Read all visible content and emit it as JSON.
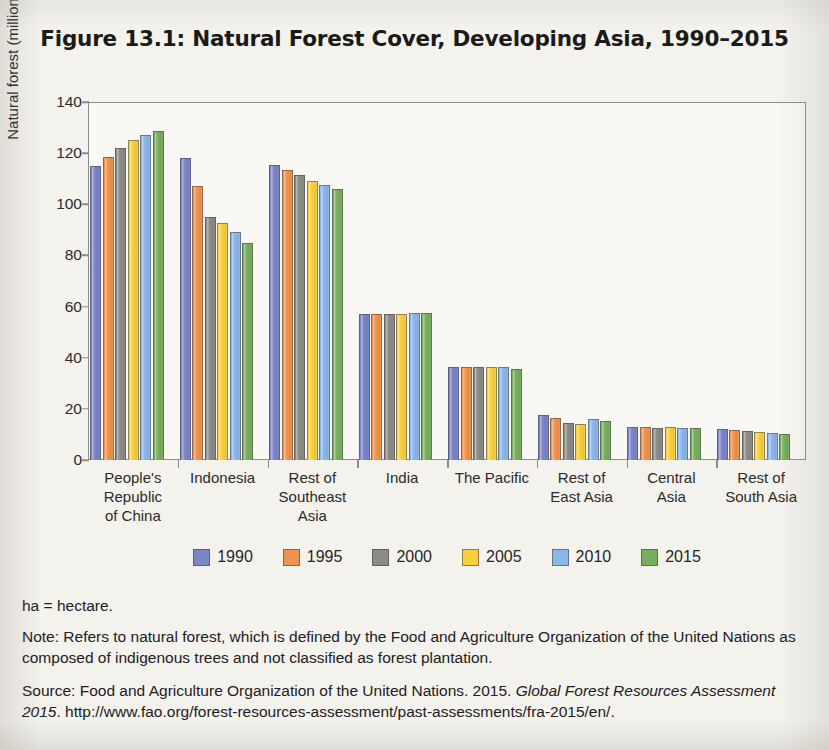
{
  "title": "Figure 13.1: Natural Forest Cover, Developing Asia, 1990–2015",
  "axes": {
    "ylabel": "Natural forest (million ha)",
    "yticks": [
      "140",
      "120",
      "100",
      "80",
      "60",
      "40",
      "20",
      "0"
    ]
  },
  "legend": [
    {
      "label": "1990",
      "color": "#7b85c8"
    },
    {
      "label": "1995",
      "color": "#f0934e"
    },
    {
      "label": "2000",
      "color": "#8d8b86"
    },
    {
      "label": "2005",
      "color": "#f7cf3f"
    },
    {
      "label": "2010",
      "color": "#8cb6e8"
    },
    {
      "label": "2015",
      "color": "#79ae5f"
    }
  ],
  "notes": {
    "abbrev": "ha = hectare.",
    "note": "Note: Refers to natural forest, which is defined by the Food and Agriculture Organization of the United Nations as composed of indigenous trees and not classified as forest plantation.",
    "source_prefix": "Source: Food and Agriculture Organization of the United Nations. 2015. ",
    "source_italic": "Global Forest Resources Assessment 2015",
    "source_suffix": ". http://www.fao.org/forest-resources-assessment/past-assessments/fra-2015/en/."
  },
  "chart_data": {
    "type": "bar",
    "title": "Figure 13.1: Natural Forest Cover, Developing Asia, 1990–2015",
    "xlabel": "",
    "ylabel": "Natural forest (million ha)",
    "ylim": [
      0,
      140
    ],
    "ytick_step": 20,
    "grid": false,
    "legend_position": "bottom",
    "categories": [
      "People's Republic of China",
      "Indonesia",
      "Rest of Southeast Asia",
      "India",
      "The Pacific",
      "Rest of East Asia",
      "Central Asia",
      "Rest of South Asia"
    ],
    "category_lines": [
      [
        "People's",
        "Republic",
        "of China"
      ],
      [
        "Indonesia"
      ],
      [
        "Rest of",
        "Southeast",
        "Asia"
      ],
      [
        "India"
      ],
      [
        "The Pacific"
      ],
      [
        "Rest of",
        "East Asia"
      ],
      [
        "Central",
        "Asia"
      ],
      [
        "Rest of",
        "South Asia"
      ]
    ],
    "series": [
      {
        "name": "1990",
        "color": "#7b85c8",
        "values": [
          115,
          118,
          115.5,
          57,
          36.5,
          17.5,
          13,
          12.3
        ]
      },
      {
        "name": "1995",
        "color": "#f0934e",
        "values": [
          118.5,
          107,
          113.5,
          57,
          36.5,
          16.5,
          13,
          11.7
        ]
      },
      {
        "name": "2000",
        "color": "#8d8b86",
        "values": [
          122,
          95,
          111.5,
          57,
          36.5,
          14.5,
          12.7,
          11.4
        ]
      },
      {
        "name": "2005",
        "color": "#f7cf3f",
        "values": [
          125,
          92.5,
          109,
          57,
          36.5,
          14.2,
          13,
          10.8
        ]
      },
      {
        "name": "2010",
        "color": "#8cb6e8",
        "values": [
          127,
          89,
          107.5,
          57.5,
          36.3,
          16,
          12.5,
          10.6
        ]
      },
      {
        "name": "2015",
        "color": "#79ae5f",
        "values": [
          128.5,
          85,
          106,
          57.5,
          35.5,
          15.3,
          12.5,
          10.3
        ]
      }
    ]
  }
}
